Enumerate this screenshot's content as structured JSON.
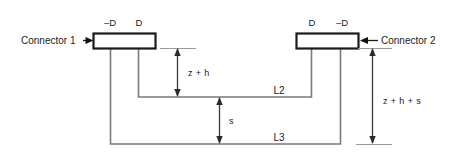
{
  "diagram": {
    "background_color": "#ffffff",
    "wire_color": "#7a7a7a",
    "box_stroke_color": "#1a1a1a",
    "text_color": "#1b1b1b",
    "connectors": [
      {
        "id": "connector-1",
        "label": "Connector 1",
        "terminal_left": "–D",
        "terminal_right": "D"
      },
      {
        "id": "connector-2",
        "label": "Connector 2",
        "terminal_left": "D",
        "terminal_right": "–D"
      }
    ],
    "loops": [
      {
        "id": "loop-l2",
        "label": "L2"
      },
      {
        "id": "loop-l3",
        "label": "L3"
      }
    ],
    "dimensions": [
      {
        "id": "dim-z-h",
        "label": "z + h"
      },
      {
        "id": "dim-s",
        "label": "s"
      },
      {
        "id": "dim-z-h-s",
        "label": "z + h + s"
      }
    ]
  }
}
